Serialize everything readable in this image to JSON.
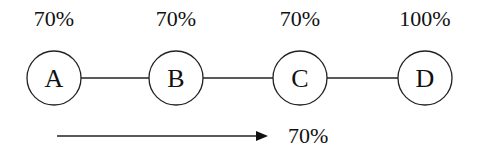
{
  "nodes": [
    {
      "label": "A",
      "percent": "70%"
    },
    {
      "label": "B",
      "percent": "70%"
    },
    {
      "label": "C",
      "percent": "70%"
    },
    {
      "label": "D",
      "percent": "100%"
    }
  ],
  "arrow": {
    "label": "70%",
    "direction": "right"
  }
}
